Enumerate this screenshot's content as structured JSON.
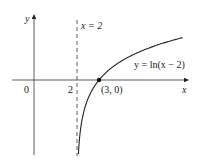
{
  "chart_data": {
    "type": "line",
    "title": "",
    "xlabel": "x",
    "ylabel": "y",
    "series": [
      {
        "name": "y = ln(x − 2)",
        "function": "ln(x-2)",
        "x_range": [
          2.0,
          6.8
        ]
      }
    ],
    "asymptote": {
      "type": "vertical",
      "x": 2,
      "label": "x = 2",
      "style": "dashed"
    },
    "points": [
      {
        "x": 3,
        "y": 0,
        "label": "(3, 0)"
      }
    ],
    "tick_labels": {
      "x": [
        "0",
        "2"
      ]
    },
    "grid": false,
    "legend": "none"
  },
  "labels": {
    "y_axis": "y",
    "x_axis": "x",
    "origin": "0",
    "tick_2": "2",
    "asymptote": "x = 2",
    "curve": "y = ln(x − 2)",
    "point": "(3, 0)"
  }
}
